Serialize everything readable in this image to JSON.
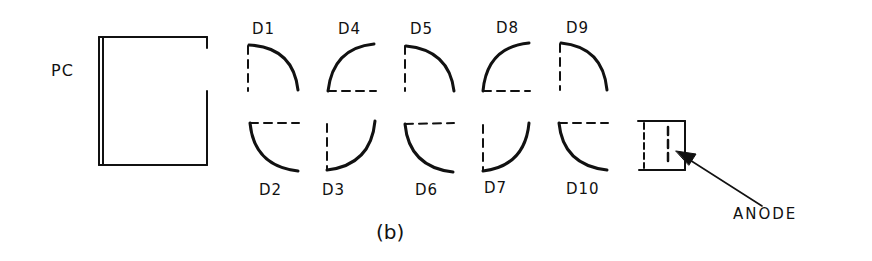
{
  "figure": {
    "caption": "(b)",
    "photocathode_label": "PC",
    "anode_label": "ANODE",
    "dynodes_top": [
      {
        "label": "D1",
        "shape": "arc-down-right"
      },
      {
        "label": "D4",
        "shape": "arc-up-left"
      },
      {
        "label": "D5",
        "shape": "arc-down-right"
      },
      {
        "label": "D8",
        "shape": "arc-up-left"
      },
      {
        "label": "D9",
        "shape": "arc-down-right"
      }
    ],
    "dynodes_bottom": [
      {
        "label": "D2",
        "shape": "arc-down-left"
      },
      {
        "label": "D3",
        "shape": "arc-up-right"
      },
      {
        "label": "D6",
        "shape": "arc-down-left"
      },
      {
        "label": "D7",
        "shape": "arc-up-right"
      },
      {
        "label": "D10",
        "shape": "arc-down-left"
      }
    ],
    "stroke_color": "#111111",
    "background_color": "#ffffff"
  }
}
